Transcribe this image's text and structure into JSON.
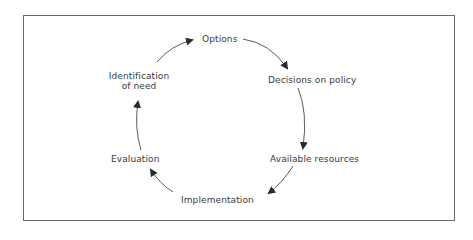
{
  "diagram": {
    "type": "cycle",
    "direction": "clockwise",
    "colors": {
      "border": "#6a6a6a",
      "text": "#3a3a3a",
      "arrow": "#2a2a2a"
    },
    "nodes": [
      {
        "id": "options",
        "label": "Options"
      },
      {
        "id": "decisions",
        "label": "Decisions on policy"
      },
      {
        "id": "resources",
        "label": "Available resources"
      },
      {
        "id": "implementation",
        "label": "Implementation"
      },
      {
        "id": "evaluation",
        "label": "Evaluation"
      },
      {
        "id": "identification",
        "label_line1": "Identification",
        "label_line2": "of need"
      }
    ],
    "edges": [
      {
        "from": "options",
        "to": "decisions"
      },
      {
        "from": "decisions",
        "to": "resources"
      },
      {
        "from": "resources",
        "to": "implementation"
      },
      {
        "from": "implementation",
        "to": "evaluation"
      },
      {
        "from": "evaluation",
        "to": "identification"
      },
      {
        "from": "identification",
        "to": "options"
      }
    ]
  }
}
